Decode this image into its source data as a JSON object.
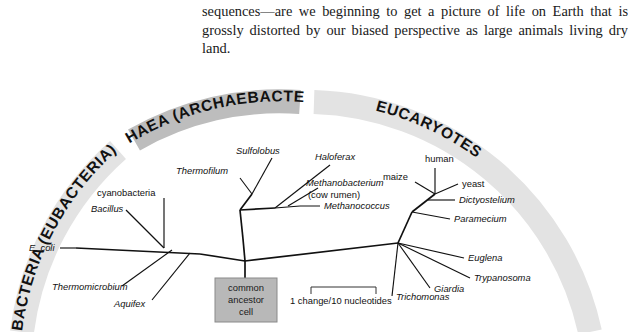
{
  "paragraph": {
    "text": "sequences—are we beginning to get a picture of life on Earth that is grossly distorted by our biased perspective as large animals living dry land."
  },
  "figure": {
    "domains": [
      {
        "id": "bacteria",
        "label": "BACTERIA (EUBACTERIA)",
        "band_color": "#e3e3e3"
      },
      {
        "id": "archaea",
        "label": "ARCHAEA (ARCHAEBACTERIA)",
        "band_color": "#bdbdbd"
      },
      {
        "id": "eucaryotes",
        "label": "EUCARYOTES",
        "band_color": "#e3e3e3"
      }
    ],
    "root_box": {
      "line1": "common",
      "line2": "ancestor",
      "line3": "cell",
      "fill": "#b8b8b8",
      "stroke": "#8a8a8a"
    },
    "scale": {
      "label": "1 change/10 nucleotides"
    },
    "taxa": [
      {
        "id": "cyanobacteria",
        "label": "cyanobacteria",
        "italic": false,
        "domain": "bacteria"
      },
      {
        "id": "bacillus",
        "label": "Bacillus",
        "italic": true,
        "domain": "bacteria"
      },
      {
        "id": "ecoli",
        "label": "E. coli",
        "italic": true,
        "domain": "bacteria"
      },
      {
        "id": "thermomicrobium",
        "label": "Thermomicrobium",
        "italic": true,
        "domain": "bacteria"
      },
      {
        "id": "aquifex",
        "label": "Aquifex",
        "italic": true,
        "domain": "bacteria"
      },
      {
        "id": "sulfolobus",
        "label": "Sulfolobus",
        "italic": true,
        "domain": "archaea"
      },
      {
        "id": "thermofilum",
        "label": "Thermofilum",
        "italic": true,
        "domain": "archaea"
      },
      {
        "id": "haloferax",
        "label": "Haloferax",
        "italic": true,
        "domain": "archaea"
      },
      {
        "id": "methanobacterium",
        "label": "Methanobacterium",
        "italic": true,
        "domain": "archaea",
        "sublabel": "(cow rumen)"
      },
      {
        "id": "methanococcus",
        "label": "Methanococcus",
        "italic": true,
        "domain": "archaea"
      },
      {
        "id": "human",
        "label": "human",
        "italic": false,
        "domain": "eucaryotes"
      },
      {
        "id": "maize",
        "label": "maize",
        "italic": false,
        "domain": "eucaryotes"
      },
      {
        "id": "yeast",
        "label": "yeast",
        "italic": false,
        "domain": "eucaryotes"
      },
      {
        "id": "dictyostelium",
        "label": "Dictyostelium",
        "italic": true,
        "domain": "eucaryotes"
      },
      {
        "id": "paramecium",
        "label": "Paramecium",
        "italic": true,
        "domain": "eucaryotes"
      },
      {
        "id": "euglena",
        "label": "Euglena",
        "italic": true,
        "domain": "eucaryotes"
      },
      {
        "id": "trypanosoma",
        "label": "Trypanosoma",
        "italic": true,
        "domain": "eucaryotes"
      },
      {
        "id": "giardia",
        "label": "Giardia",
        "italic": true,
        "domain": "eucaryotes"
      },
      {
        "id": "trichomonas",
        "label": "Trichomonas",
        "italic": true,
        "domain": "eucaryotes"
      }
    ]
  }
}
